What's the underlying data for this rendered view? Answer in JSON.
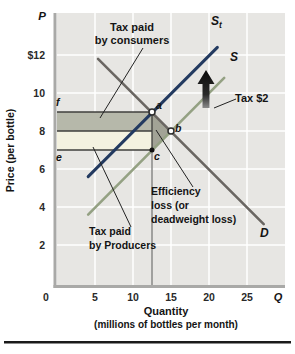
{
  "figure": {
    "p_symbol": "P",
    "q_symbol": "Q",
    "y_axis_title": "Price (per bottle)",
    "x_axis_title_line1": "Quantity",
    "x_axis_title_line2": "(millions of bottles per month)"
  },
  "annotations": {
    "consumers_line1": "Tax paid",
    "consumers_line2": "by consumers",
    "producers_line1": "Tax paid",
    "producers_line2": "by Producers",
    "efficiency_line1": "Efficiency",
    "efficiency_line2": "loss (or",
    "efficiency_line3": "deadweight loss)",
    "tax_label": "Tax $2"
  },
  "curves": {
    "st_main": "S",
    "st_sub": "t",
    "s_label": "S",
    "d_label": "D"
  },
  "colors": {
    "plot_bg": "#e7e6e3",
    "grid": "#ffffff",
    "axis": "#a9a9a7",
    "consumer_region": "#b6b8aa",
    "producer_region": "#f4f2e0",
    "deadweight_region": "#a2a396",
    "boundary_line": "#3f3f3d",
    "dropline": "#8f8f8d",
    "pointer_line": "#222222",
    "arrow_top": "#0b0b0b",
    "arrow_bottom": "#8a8a8a",
    "divider": "#1a1a1a"
  },
  "chart_data": {
    "type": "line",
    "title": "",
    "xlabel": "Quantity (millions of bottles per month)",
    "ylabel": "Price (per bottle)",
    "xlim": [
      0,
      30
    ],
    "ylim": [
      0,
      14
    ],
    "x_ticks": [
      0,
      5,
      10,
      15,
      20,
      25
    ],
    "x_tick_labels": [
      "0",
      "5",
      "10",
      "15",
      "20",
      "25"
    ],
    "y_ticks": [
      12,
      10,
      8,
      6,
      4,
      2
    ],
    "y_tick_labels": [
      "$12",
      "10",
      "8",
      "6",
      "4",
      "2"
    ],
    "grid": true,
    "tax_per_unit_dollars": 2,
    "series": [
      {
        "name": "D (demand)",
        "color": "#6a6662",
        "width": 2.6,
        "points": [
          [
            5.4,
            11.8
          ],
          [
            27.2,
            3.1
          ]
        ]
      },
      {
        "name": "S (supply, no tax)",
        "color": "#94a183",
        "width": 2.6,
        "points": [
          [
            4.1,
            3.6
          ],
          [
            22.0,
            10.8
          ]
        ]
      },
      {
        "name": "St (supply plus tax)",
        "color": "#233a60",
        "width": 3,
        "points": [
          [
            4.1,
            5.6
          ],
          [
            21.1,
            12.4
          ]
        ]
      }
    ],
    "key_points": {
      "a": {
        "label": "a",
        "q": 12.5,
        "p": 9,
        "style": "open",
        "meaning": "equilibrium with tax (price paid by consumers)"
      },
      "b": {
        "label": "b",
        "q": 15,
        "p": 8,
        "style": "open",
        "meaning": "equilibrium without tax"
      },
      "c": {
        "label": "c",
        "q": 12.5,
        "p": 7,
        "style": "filled",
        "meaning": "price received by producers after tax"
      },
      "e": {
        "label": "e",
        "p": 7
      },
      "f": {
        "label": "f",
        "p": 9
      }
    },
    "regions": {
      "tax_paid_by_consumers": {
        "q_range": [
          0,
          12.5
        ],
        "p_range": [
          8,
          9
        ]
      },
      "tax_paid_by_producers": {
        "q_range": [
          0,
          12.5
        ],
        "p_range": [
          7,
          8
        ]
      },
      "deadweight_loss_triangle": [
        [
          12.5,
          9
        ],
        [
          15,
          8
        ],
        [
          12.5,
          7
        ]
      ]
    },
    "boundary_prices": [
      9,
      8,
      7
    ],
    "dropline_quantity": 12.5
  }
}
